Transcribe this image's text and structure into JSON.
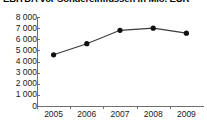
{
  "chart_data": {
    "type": "line",
    "title": "EBITDA vor Sondereinflüssen in Mio. EUR",
    "xlabel": "",
    "ylabel": "",
    "categories": [
      "2005",
      "2006",
      "2007",
      "2008",
      "2009"
    ],
    "x": [
      2005,
      2006,
      2007,
      2008,
      2009
    ],
    "values": [
      4600,
      5600,
      6800,
      7000,
      6550
    ],
    "series": [
      {
        "name": "EBITDA vor Sondereinflüssen",
        "values": [
          4600,
          5600,
          6800,
          7000,
          6550
        ]
      }
    ],
    "ylim": [
      0,
      8000
    ],
    "ytick_step": 1000,
    "ytick_labels": [
      "8 000",
      "7 000",
      "6 000",
      "5 000",
      "4 000",
      "3 000",
      "2 000",
      "1 000",
      "0"
    ],
    "ytick_values": [
      8000,
      7000,
      6000,
      5000,
      4000,
      3000,
      2000,
      1000,
      0
    ],
    "xtick_labels": [
      "2005",
      "2006",
      "2007",
      "2008",
      "2009"
    ],
    "grid": false,
    "legend": false,
    "legend_position": "none",
    "marker": "circle",
    "line_color": "#3a3a3a",
    "marker_color": "#111111",
    "axis_color": "#6f6f6f",
    "background_color": "#ffffff"
  }
}
